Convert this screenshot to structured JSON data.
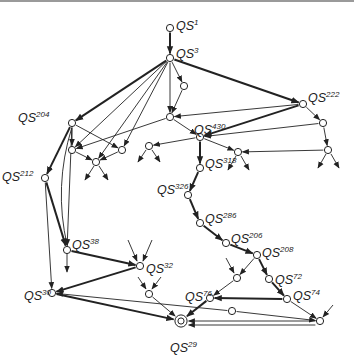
{
  "diagram": {
    "title": "",
    "colors": {
      "line": "#222222",
      "node_fill": "#ffffff",
      "topline": "#9a9a9a"
    },
    "nodes": [
      {
        "id": "n1",
        "x": 170,
        "y": 28,
        "label": "QS",
        "sup": "1",
        "lx": 176,
        "ly": 26
      },
      {
        "id": "n3",
        "x": 170,
        "y": 58,
        "label": "QS",
        "sup": "3",
        "lx": 176,
        "ly": 54
      },
      {
        "id": "na",
        "x": 184,
        "y": 86
      },
      {
        "id": "nb",
        "x": 170,
        "y": 117
      },
      {
        "id": "n222",
        "x": 303,
        "y": 104,
        "label": "QS",
        "sup": "222",
        "lx": 308,
        "ly": 98
      },
      {
        "id": "n204",
        "x": 72,
        "y": 123,
        "label": "QS",
        "sup": "204",
        "lx": 18,
        "ly": 118
      },
      {
        "id": "n430",
        "x": 200,
        "y": 137,
        "label": "QS",
        "sup": "430",
        "lx": 194,
        "ly": 130
      },
      {
        "id": "nc",
        "x": 323,
        "y": 123
      },
      {
        "id": "nd",
        "x": 72,
        "y": 150
      },
      {
        "id": "ne",
        "x": 122,
        "y": 150
      },
      {
        "id": "nf",
        "x": 149,
        "y": 146
      },
      {
        "id": "ng",
        "x": 96,
        "y": 162
      },
      {
        "id": "nh",
        "x": 238,
        "y": 152
      },
      {
        "id": "ni",
        "x": 328,
        "y": 150
      },
      {
        "id": "n318",
        "x": 200,
        "y": 168,
        "label": "QS",
        "sup": "318",
        "lx": 205,
        "ly": 164
      },
      {
        "id": "n212",
        "x": 45,
        "y": 178,
        "label": "QS",
        "sup": "212",
        "lx": 2,
        "ly": 177
      },
      {
        "id": "n326",
        "x": 188,
        "y": 195,
        "label": "QS",
        "sup": "326",
        "lx": 157,
        "ly": 190
      },
      {
        "id": "n286",
        "x": 200,
        "y": 223,
        "label": "QS",
        "sup": "286",
        "lx": 205,
        "ly": 219
      },
      {
        "id": "n38",
        "x": 67,
        "y": 250,
        "label": "QS",
        "sup": "38",
        "lx": 72,
        "ly": 245
      },
      {
        "id": "n206",
        "x": 226,
        "y": 243,
        "label": "QS",
        "sup": "206",
        "lx": 231,
        "ly": 239
      },
      {
        "id": "n208",
        "x": 257,
        "y": 255,
        "label": "QS",
        "sup": "208",
        "lx": 262,
        "ly": 253
      },
      {
        "id": "n32",
        "x": 140,
        "y": 266,
        "label": "QS",
        "sup": "32",
        "lx": 146,
        "ly": 269
      },
      {
        "id": "nj",
        "x": 237,
        "y": 278
      },
      {
        "id": "n72",
        "x": 269,
        "y": 279,
        "label": "QS",
        "sup": "72",
        "lx": 275,
        "ly": 280
      },
      {
        "id": "nk",
        "x": 149,
        "y": 294
      },
      {
        "id": "n30",
        "x": 52,
        "y": 293,
        "label": "QS",
        "sup": "30",
        "lx": 24,
        "ly": 296
      },
      {
        "id": "n76",
        "x": 210,
        "y": 298,
        "label": "QS",
        "sup": "76",
        "lx": 185,
        "ly": 297
      },
      {
        "id": "n74",
        "x": 287,
        "y": 299,
        "label": "QS",
        "sup": "74",
        "lx": 293,
        "ly": 296
      },
      {
        "id": "nl",
        "x": 232,
        "y": 311
      },
      {
        "id": "nm",
        "x": 320,
        "y": 321
      },
      {
        "id": "n29",
        "x": 181,
        "y": 321,
        "label": "QS",
        "sup": "29",
        "lx": 170,
        "ly": 348,
        "double": true
      }
    ],
    "edges": [
      {
        "from": "n1",
        "to": "n3",
        "bold": true
      },
      {
        "from": "n3",
        "to": "n204",
        "bold": true
      },
      {
        "from": "n3",
        "to": "n222",
        "bold": true
      },
      {
        "from": "n3",
        "to": "na"
      },
      {
        "from": "n3",
        "to": "nb"
      },
      {
        "from": "n3",
        "to": "nd"
      },
      {
        "from": "n3",
        "to": "ng"
      },
      {
        "from": "n3",
        "to": "ne"
      },
      {
        "from": "na",
        "to": "nb"
      },
      {
        "from": "nb",
        "to": "n430"
      },
      {
        "from": "n222",
        "to": "nb"
      },
      {
        "from": "n222",
        "to": "n430",
        "bold": true
      },
      {
        "from": "n222",
        "to": "nc"
      },
      {
        "from": "nc",
        "to": "n430"
      },
      {
        "from": "nc",
        "to": "ni"
      },
      {
        "from": "nb",
        "to": "nd"
      },
      {
        "from": "n430",
        "to": "nf"
      },
      {
        "from": "n430",
        "to": "nh"
      },
      {
        "from": "ni",
        "to": "nh"
      },
      {
        "from": "n430",
        "to": "n318",
        "bold": true
      },
      {
        "from": "n204",
        "to": "nd"
      },
      {
        "from": "n204",
        "to": "ne"
      },
      {
        "from": "n204",
        "to": "n212",
        "bold": true
      },
      {
        "from": "n204",
        "to": "n38"
      },
      {
        "from": "n204",
        "to": "n38",
        "curve": true
      },
      {
        "from": "nd",
        "to": "ng"
      },
      {
        "from": "ne",
        "to": "ng"
      },
      {
        "from": "n212",
        "to": "n38",
        "bold": true
      },
      {
        "from": "n212",
        "to": "n30"
      },
      {
        "from": "n318",
        "to": "n326",
        "bold": true
      },
      {
        "from": "n326",
        "to": "n286",
        "bold": true
      },
      {
        "from": "n286",
        "to": "n206",
        "bold": true
      },
      {
        "from": "n206",
        "to": "n208",
        "bold": true
      },
      {
        "from": "n208",
        "to": "nj"
      },
      {
        "from": "n208",
        "to": "n72",
        "bold": true
      },
      {
        "from": "n72",
        "to": "n74",
        "bold": true
      },
      {
        "from": "nj",
        "to": "n76"
      },
      {
        "from": "n74",
        "to": "n76",
        "bold": true
      },
      {
        "from": "n74",
        "to": "nm"
      },
      {
        "from": "n38",
        "to": "n32",
        "bold": true
      },
      {
        "from": "n32",
        "to": "n30",
        "bold": true
      },
      {
        "from": "n30",
        "to": "n29",
        "bold": true
      },
      {
        "from": "nk",
        "to": "n29"
      },
      {
        "from": "n76",
        "to": "n29",
        "bold": true
      },
      {
        "from": "nl",
        "to": "n30"
      },
      {
        "from": "nl",
        "to": "nm"
      },
      {
        "from": "nm",
        "to": "n29"
      },
      {
        "from": "nm",
        "to": "n29",
        "offset": true
      }
    ],
    "stubs": [
      {
        "x1": 146,
        "y1": 150,
        "x2": 138,
        "y2": 162
      },
      {
        "x1": 152,
        "y1": 150,
        "x2": 160,
        "y2": 162
      },
      {
        "x1": 94,
        "y1": 166,
        "x2": 85,
        "y2": 180
      },
      {
        "x1": 99,
        "y1": 166,
        "x2": 108,
        "y2": 180
      },
      {
        "x1": 236,
        "y1": 156,
        "x2": 228,
        "y2": 170
      },
      {
        "x1": 241,
        "y1": 156,
        "x2": 249,
        "y2": 170
      },
      {
        "x1": 326,
        "y1": 154,
        "x2": 318,
        "y2": 168
      },
      {
        "x1": 331,
        "y1": 154,
        "x2": 339,
        "y2": 168
      },
      {
        "x1": 67,
        "y1": 254,
        "x2": 67,
        "y2": 272
      },
      {
        "x1": 128,
        "y1": 240,
        "x2": 137,
        "y2": 261
      },
      {
        "x1": 152,
        "y1": 240,
        "x2": 143,
        "y2": 261
      },
      {
        "x1": 138,
        "y1": 277,
        "x2": 146,
        "y2": 289
      },
      {
        "x1": 161,
        "y1": 277,
        "x2": 152,
        "y2": 289
      },
      {
        "x1": 226,
        "y1": 258,
        "x2": 234,
        "y2": 273
      },
      {
        "x1": 333,
        "y1": 305,
        "x2": 323,
        "y2": 317
      }
    ]
  }
}
